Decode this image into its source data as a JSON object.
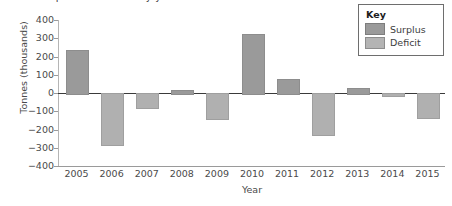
{
  "clipped_title": "Grain surplus and deficit by year",
  "chart_data": {
    "type": "bar",
    "title": "",
    "xlabel": "Year",
    "ylabel": "Tonnes (thousands)",
    "categories": [
      "2005",
      "2006",
      "2007",
      "2008",
      "2009",
      "2010",
      "2011",
      "2012",
      "2013",
      "2014",
      "2015"
    ],
    "values": [
      235,
      -280,
      -75,
      15,
      -135,
      325,
      75,
      -225,
      25,
      -10,
      -130
    ],
    "ylim": [
      -400,
      400
    ],
    "yticks": [
      400,
      300,
      200,
      100,
      0,
      -100,
      -200,
      -300,
      -400
    ],
    "ytick_labels": [
      "400",
      "300",
      "200",
      "100",
      "0",
      "−100",
      "−200",
      "−300",
      "−400"
    ],
    "grid": false,
    "zero_line": true,
    "legend_position": "top-right",
    "series": [
      {
        "name": "Surplus",
        "color": "#9a9a9a",
        "sign": "positive"
      },
      {
        "name": "Deficit",
        "color": "#b4b4b4",
        "sign": "negative"
      }
    ]
  },
  "legend": {
    "title": "Key",
    "items": [
      {
        "label": "Surplus",
        "swatch": "surplus"
      },
      {
        "label": "Deficit",
        "swatch": "deficit"
      }
    ]
  }
}
